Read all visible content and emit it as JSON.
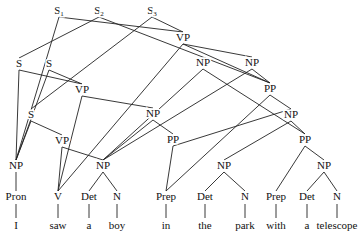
{
  "diagram": {
    "type": "parse-forest",
    "roots": [
      {
        "id": "S1",
        "label": "S",
        "sub": "1",
        "x": 59,
        "y": 14
      },
      {
        "id": "S2",
        "label": "S",
        "sub": "2",
        "x": 99,
        "y": 14
      },
      {
        "id": "S3",
        "label": "S",
        "sub": "3",
        "x": 152,
        "y": 14
      }
    ],
    "nodes": [
      {
        "id": "VP_top",
        "label": "VP",
        "x": 183,
        "y": 41
      },
      {
        "id": "S_a",
        "label": "S",
        "x": 19,
        "y": 67
      },
      {
        "id": "S_b",
        "label": "S",
        "x": 49,
        "y": 67
      },
      {
        "id": "NP_top1",
        "label": "NP",
        "x": 203,
        "y": 66
      },
      {
        "id": "NP_top2",
        "label": "NP",
        "x": 252,
        "y": 66
      },
      {
        "id": "VP_mid",
        "label": "VP",
        "x": 82,
        "y": 93
      },
      {
        "id": "PP_top",
        "label": "PP",
        "x": 270,
        "y": 92
      },
      {
        "id": "NP_mid",
        "label": "NP",
        "x": 153,
        "y": 117
      },
      {
        "id": "NP_r1",
        "label": "NP",
        "x": 291,
        "y": 118
      },
      {
        "id": "S_c",
        "label": "S",
        "x": 31,
        "y": 118
      },
      {
        "id": "VP_low",
        "label": "VP",
        "x": 62,
        "y": 144
      },
      {
        "id": "PP_mid",
        "label": "PP",
        "x": 173,
        "y": 143
      },
      {
        "id": "PP_r2",
        "label": "PP",
        "x": 305,
        "y": 143
      },
      {
        "id": "NP_I",
        "label": "NP",
        "x": 16,
        "y": 169
      },
      {
        "id": "NP_aboy",
        "label": "NP",
        "x": 103,
        "y": 169
      },
      {
        "id": "NP_park",
        "label": "NP",
        "x": 224,
        "y": 169
      },
      {
        "id": "NP_tele",
        "label": "NP",
        "x": 324,
        "y": 169
      },
      {
        "id": "Pron",
        "label": "Pron",
        "x": 16,
        "y": 200
      },
      {
        "id": "V",
        "label": "V",
        "x": 58,
        "y": 200
      },
      {
        "id": "Det1",
        "label": "Det",
        "x": 89,
        "y": 200
      },
      {
        "id": "N1",
        "label": "N",
        "x": 117,
        "y": 200
      },
      {
        "id": "Prep1",
        "label": "Prep",
        "x": 166,
        "y": 200
      },
      {
        "id": "Det2",
        "label": "Det",
        "x": 205,
        "y": 200
      },
      {
        "id": "N2",
        "label": "N",
        "x": 245,
        "y": 200
      },
      {
        "id": "Prep2",
        "label": "Prep",
        "x": 276,
        "y": 200
      },
      {
        "id": "Det3",
        "label": "Det",
        "x": 307,
        "y": 200
      },
      {
        "id": "N3",
        "label": "N",
        "x": 337,
        "y": 200
      }
    ],
    "words": [
      {
        "text": "I",
        "x": 16
      },
      {
        "text": "saw",
        "x": 58
      },
      {
        "text": "a",
        "x": 89
      },
      {
        "text": "boy",
        "x": 117
      },
      {
        "text": "in",
        "x": 166
      },
      {
        "text": "the",
        "x": 205
      },
      {
        "text": "park",
        "x": 245
      },
      {
        "text": "with",
        "x": 276
      },
      {
        "text": "a",
        "x": 307
      },
      {
        "text": "telescope",
        "x": 337
      }
    ],
    "words_y": 229
  }
}
